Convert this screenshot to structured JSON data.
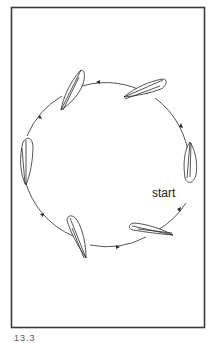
{
  "figure": {
    "start_label": "start",
    "caption": "13.3",
    "colors": {
      "stroke": "#2a2a2a",
      "frame": "#3a3a3a",
      "background": "#ffffff"
    },
    "path": {
      "shape": "circle",
      "direction": "counterclockwise",
      "center": [
        106,
        166
      ],
      "radius": 84
    },
    "leaves": [
      {
        "position": "right",
        "label": "leaf-right"
      },
      {
        "position": "upper-right",
        "label": "leaf-upper-right"
      },
      {
        "position": "upper-left",
        "label": "leaf-upper-left"
      },
      {
        "position": "left",
        "label": "leaf-left"
      },
      {
        "position": "lower-left",
        "label": "leaf-lower-left"
      },
      {
        "position": "lower-right",
        "label": "leaf-lower-right"
      }
    ]
  }
}
